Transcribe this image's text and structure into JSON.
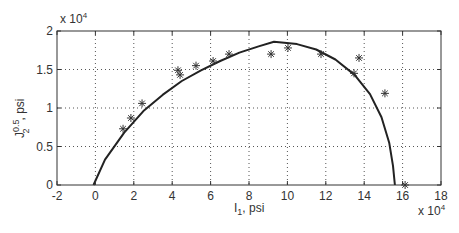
{
  "chart_data": {
    "type": "scatter",
    "title": "",
    "xlabel": "I_1, psi",
    "ylabel": "J_2^0.5, psi",
    "x_exponent_label": "x 10^4",
    "y_exponent_label": "x 10^4",
    "xlim": [
      -2,
      18
    ],
    "ylim": [
      0,
      2
    ],
    "xticks": [
      -2,
      0,
      2,
      4,
      6,
      8,
      10,
      12,
      14,
      16,
      18
    ],
    "yticks": [
      0,
      0.5,
      1,
      1.5,
      2
    ],
    "grid": true,
    "legend": null,
    "series": [
      {
        "name": "Measured data",
        "kind": "scatter",
        "marker": "*",
        "x": [
          1.44,
          1.85,
          2.43,
          4.3,
          4.41,
          5.24,
          6.13,
          6.96,
          9.15,
          10.03,
          11.75,
          13.47,
          13.73,
          15.08,
          16.13
        ],
        "y": [
          0.73,
          0.87,
          1.06,
          1.49,
          1.43,
          1.55,
          1.61,
          1.7,
          1.7,
          1.78,
          1.7,
          1.45,
          1.65,
          1.19,
          0.0
        ]
      },
      {
        "name": "Fitted yield surface",
        "kind": "line",
        "x": [
          -0.1,
          0.5,
          1.5,
          2.5,
          3.5,
          4.5,
          5.5,
          6.5,
          7.5,
          8.5,
          9.3,
          10.5,
          11.5,
          12.5,
          13.5,
          14.3,
          14.9,
          15.3,
          15.5,
          15.6
        ],
        "y": [
          0.0,
          0.33,
          0.68,
          0.96,
          1.17,
          1.35,
          1.49,
          1.61,
          1.72,
          1.8,
          1.86,
          1.83,
          1.76,
          1.63,
          1.43,
          1.18,
          0.88,
          0.55,
          0.25,
          0.0
        ]
      }
    ]
  },
  "labels": {
    "xlabel_main": "I",
    "xlabel_sub": "1",
    "xlabel_rest": ", psi",
    "ylabel_main": "J",
    "ylabel_sup": "0.5",
    "ylabel_sub": "2",
    "ylabel_rest": ", psi",
    "exp_base": "x 10",
    "exp_power": "4"
  }
}
